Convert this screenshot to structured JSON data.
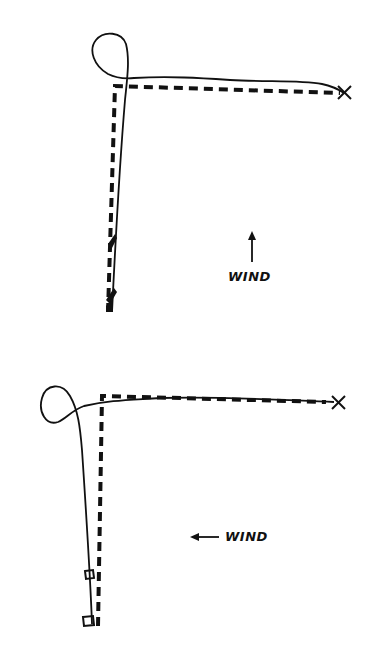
{
  "diagrams": [
    {
      "id": "top",
      "wind": {
        "label": "WIND",
        "direction": "up"
      },
      "markers": {
        "target": "X"
      },
      "legend_implicit": {
        "dashed": "intended path",
        "solid": "actual track"
      }
    },
    {
      "id": "bottom",
      "wind": {
        "label": "WIND",
        "direction": "left"
      },
      "markers": {
        "target": "X"
      },
      "legend_implicit": {
        "dashed": "intended path",
        "solid": "actual track"
      }
    }
  ],
  "colors": {
    "ink": "#111111",
    "background": "#ffffff"
  }
}
